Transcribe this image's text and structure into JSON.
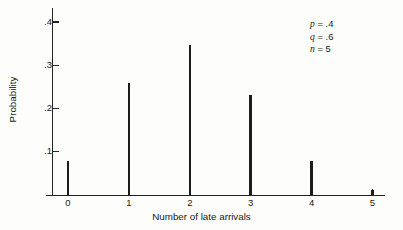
{
  "chart_data": {
    "type": "bar",
    "title": "",
    "subtitle": "",
    "xlabel": "Number of late arrivals",
    "ylabel": "Probability",
    "categories": [
      "0",
      "1",
      "2",
      "3",
      "4",
      "5"
    ],
    "values": [
      0.0778,
      0.2592,
      0.3456,
      0.2304,
      0.0768,
      0.0102
    ],
    "series": [
      {
        "name": "Binomial probability",
        "values": [
          0.0778,
          0.2592,
          0.3456,
          0.2304,
          0.0768,
          0.0102
        ]
      }
    ],
    "xlim": [
      -0.35,
      5.45
    ],
    "ylim": [
      0,
      0.44
    ],
    "ytick_values": [
      0.1,
      0.2,
      0.3,
      0.4
    ],
    "ytick_labels": [
      ".1",
      ".2",
      ".3",
      ".4"
    ],
    "xtick_values": [
      0,
      1,
      2,
      3,
      4,
      5
    ],
    "xtick_labels": [
      "0",
      "1",
      "2",
      "3",
      "4",
      "5"
    ],
    "grid": false,
    "legend": "none",
    "style": "spike",
    "bar_color": "#1c1c1c",
    "axis_color": "#222222",
    "background_color": "#fdfdfb"
  },
  "annotations": {
    "lines": [
      {
        "symbol": "p",
        "relation": " = ",
        "value": ".4"
      },
      {
        "symbol": "q",
        "relation": " = ",
        "value": ".6"
      },
      {
        "symbol": "n",
        "relation": " = ",
        "value": "5"
      }
    ],
    "position": "top-right"
  },
  "axes": {
    "x_title": "Number of late arrivals",
    "y_title": "Probability"
  }
}
